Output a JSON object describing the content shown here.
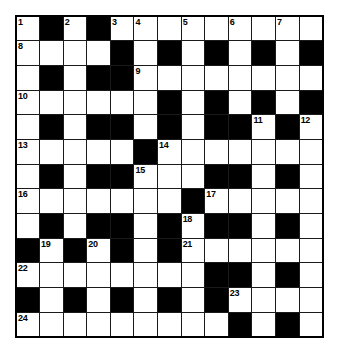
{
  "puzzle": {
    "title": "Crossword Grid",
    "type": "crossword",
    "rows": 13,
    "cols": 13,
    "colors": {
      "block": "#000000",
      "cell": "#ffffff",
      "grid_line": "#1a1a1a",
      "border": "#000000",
      "number_text": "#000000"
    },
    "legend": {
      "white": "open letter cell",
      "black": "blocked cell"
    },
    "grid": [
      [
        "W",
        "B",
        "W",
        "B",
        "W",
        "W",
        "W",
        "W",
        "W",
        "W",
        "W",
        "W",
        "W"
      ],
      [
        "W",
        "W",
        "W",
        "W",
        "B",
        "W",
        "B",
        "W",
        "B",
        "W",
        "B",
        "W",
        "B"
      ],
      [
        "W",
        "B",
        "W",
        "B",
        "B",
        "W",
        "W",
        "W",
        "W",
        "W",
        "W",
        "W",
        "W"
      ],
      [
        "W",
        "W",
        "W",
        "W",
        "W",
        "W",
        "B",
        "W",
        "B",
        "W",
        "B",
        "W",
        "B"
      ],
      [
        "W",
        "B",
        "W",
        "B",
        "B",
        "W",
        "B",
        "W",
        "B",
        "B",
        "W",
        "B",
        "W"
      ],
      [
        "W",
        "W",
        "W",
        "W",
        "W",
        "B",
        "W",
        "W",
        "W",
        "W",
        "W",
        "W",
        "W"
      ],
      [
        "W",
        "B",
        "W",
        "B",
        "B",
        "W",
        "W",
        "W",
        "B",
        "B",
        "W",
        "B",
        "W"
      ],
      [
        "W",
        "W",
        "W",
        "W",
        "W",
        "W",
        "W",
        "B",
        "W",
        "W",
        "W",
        "W",
        "W"
      ],
      [
        "W",
        "B",
        "W",
        "B",
        "B",
        "W",
        "B",
        "W",
        "B",
        "B",
        "W",
        "B",
        "W"
      ],
      [
        "B",
        "W",
        "B",
        "W",
        "B",
        "W",
        "B",
        "W",
        "W",
        "W",
        "W",
        "W",
        "W"
      ],
      [
        "W",
        "W",
        "W",
        "W",
        "W",
        "W",
        "W",
        "W",
        "B",
        "B",
        "W",
        "B",
        "W"
      ],
      [
        "B",
        "W",
        "B",
        "W",
        "B",
        "W",
        "B",
        "W",
        "B",
        "W",
        "W",
        "W",
        "W"
      ],
      [
        "W",
        "W",
        "W",
        "W",
        "W",
        "W",
        "W",
        "W",
        "W",
        "B",
        "W",
        "B",
        "W"
      ]
    ],
    "numbers": [
      {
        "row": 0,
        "col": 0,
        "label": "1"
      },
      {
        "row": 0,
        "col": 2,
        "label": "2"
      },
      {
        "row": 0,
        "col": 4,
        "label": "3"
      },
      {
        "row": 0,
        "col": 5,
        "label": "4"
      },
      {
        "row": 0,
        "col": 7,
        "label": "5"
      },
      {
        "row": 0,
        "col": 9,
        "label": "6"
      },
      {
        "row": 0,
        "col": 11,
        "label": "7"
      },
      {
        "row": 1,
        "col": 0,
        "label": "8"
      },
      {
        "row": 2,
        "col": 5,
        "label": "9"
      },
      {
        "row": 3,
        "col": 0,
        "label": "10"
      },
      {
        "row": 4,
        "col": 10,
        "label": "11"
      },
      {
        "row": 4,
        "col": 12,
        "label": "12"
      },
      {
        "row": 5,
        "col": 0,
        "label": "13"
      },
      {
        "row": 5,
        "col": 6,
        "label": "14"
      },
      {
        "row": 6,
        "col": 5,
        "label": "15"
      },
      {
        "row": 7,
        "col": 0,
        "label": "16"
      },
      {
        "row": 7,
        "col": 8,
        "label": "17"
      },
      {
        "row": 8,
        "col": 7,
        "label": "18"
      },
      {
        "row": 9,
        "col": 1,
        "label": "19"
      },
      {
        "row": 9,
        "col": 3,
        "label": "20"
      },
      {
        "row": 9,
        "col": 7,
        "label": "21"
      },
      {
        "row": 10,
        "col": 0,
        "label": "22"
      },
      {
        "row": 11,
        "col": 9,
        "label": "23"
      },
      {
        "row": 12,
        "col": 0,
        "label": "24"
      }
    ]
  }
}
